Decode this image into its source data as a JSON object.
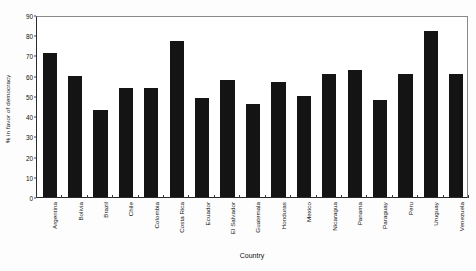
{
  "chart_data": {
    "type": "bar",
    "title": "",
    "xlabel": "Country",
    "ylabel": "% in favor of democracy",
    "categories": [
      "Argentina",
      "Bolivia",
      "Brazil",
      "Chile",
      "Colombia",
      "Costa Rica",
      "Ecuador",
      "El Salvador",
      "Guatemala",
      "Honduras",
      "Mexico",
      "Nicaragua",
      "Panama",
      "Paraguay",
      "Peru",
      "Uruguay",
      "Venezuela"
    ],
    "values": [
      71,
      60,
      43,
      54,
      54,
      77,
      49,
      58,
      46,
      57,
      50,
      61,
      63,
      48,
      61,
      82,
      61
    ],
    "ylim": [
      0,
      90
    ],
    "yticks": [
      0,
      10,
      20,
      30,
      40,
      50,
      60,
      70,
      80,
      90
    ],
    "ytick_labels": [
      "0",
      "10",
      "20",
      "30",
      "40",
      "50",
      "60",
      "70",
      "80",
      "90"
    ],
    "grid": false,
    "legend": false,
    "bar_color": "#141414",
    "frame_color": "#2a2a2a",
    "background_color": "#ffffff"
  }
}
